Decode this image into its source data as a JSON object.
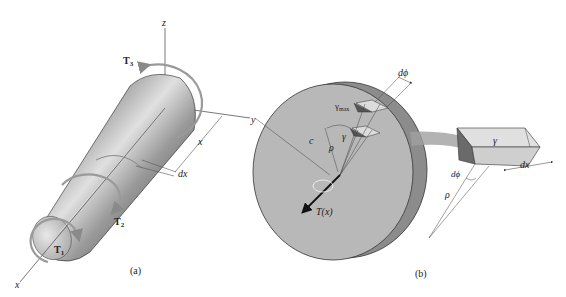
{
  "figure": {
    "panels": [
      {
        "id": "a",
        "caption": "(a)",
        "description": "Tapered shaft subjected to torques along its axis",
        "labels": {
          "z_axis": "z",
          "y_axis": "y",
          "x_axis_top": "x",
          "x_axis_bottom": "x",
          "torque_1": "T",
          "torque_1_sub": "1",
          "torque_2": "T",
          "torque_2_sub": "2",
          "torque_3": "T",
          "torque_3_sub": "3",
          "element_length": "dx"
        }
      },
      {
        "id": "b",
        "caption": "(b)",
        "description": "Disk cross-section with internal torque and shear strain element",
        "labels": {
          "internal_torque": "T(x)",
          "radius_outer": "c",
          "radius_rho": "ρ",
          "gamma_max": "γ",
          "gamma_max_sub": "max",
          "gamma": "γ",
          "d_phi_top": "dϕ",
          "d_phi_bottom": "dϕ",
          "rho_bottom": "ρ",
          "gamma_element": "γ",
          "element_length": "dx"
        }
      }
    ],
    "colors": {
      "disk_face": "#b8b8b8",
      "disk_rim": "#8c8c8c",
      "shaft_dark": "#3a3a3a",
      "shaft_light": "#d8d8d8",
      "arrow": "#9a9a9a",
      "line": "#444444"
    }
  }
}
